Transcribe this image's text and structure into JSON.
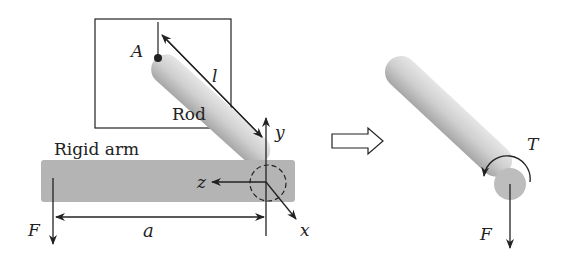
{
  "diagram": {
    "left_panel": {
      "labels": {
        "point": "A",
        "length": "l",
        "rod": "Rod",
        "arm": "Rigid arm",
        "axis_y": "y",
        "axis_z": "z",
        "axis_x": "x",
        "force": "F",
        "distance": "a"
      }
    },
    "transition_arrow": "hollow-right-arrow",
    "right_panel": {
      "labels": {
        "torque": "T",
        "force": "F"
      }
    },
    "colors": {
      "arm_fill": "#b4b4b4",
      "rod_light": "#e4e4e4",
      "rod_dark": "#a8a8a8",
      "line": "#222222"
    }
  }
}
